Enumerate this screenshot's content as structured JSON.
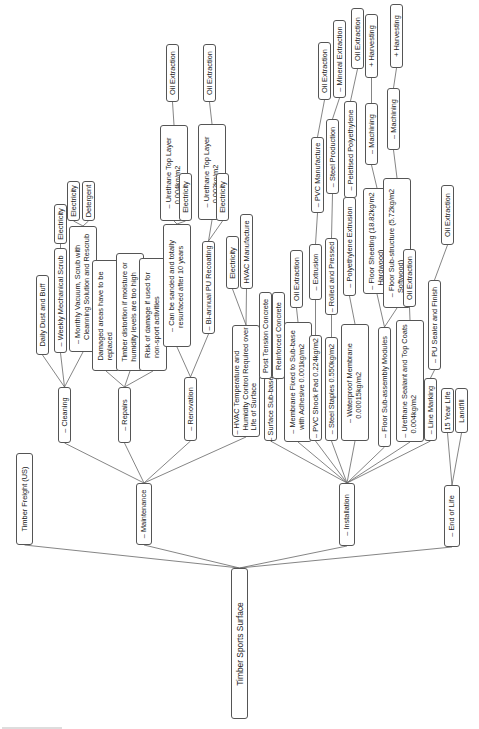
{
  "diagram": {
    "title": "Timber Sports Surface",
    "nodes": [
      {
        "id": "root",
        "label": "Timber Sports Surface"
      },
      {
        "id": "freight",
        "label": "Timber Freight (US)"
      },
      {
        "id": "maintenance",
        "label": "– Maintenance"
      },
      {
        "id": "installation",
        "label": "– Installation"
      },
      {
        "id": "endoflife",
        "label": "– End of Life"
      },
      {
        "id": "cleaning",
        "label": "– Cleaning"
      },
      {
        "id": "repairs",
        "label": "– Repairs"
      },
      {
        "id": "renovation",
        "label": "– Renovation"
      },
      {
        "id": "hvac",
        "label": "– HVAC Temperature and\n  Humidity Control Required over\n  Life of Surface"
      },
      {
        "id": "daily",
        "label": "Daily Dust and Buff"
      },
      {
        "id": "weekly",
        "label": "– Weekly Mechanical Scrub"
      },
      {
        "id": "monthly",
        "label": "– Monthly Vacuum, Scrub with\n  Cleanning Solution and Rescrub"
      },
      {
        "id": "weekly_elec",
        "label": "Electricity"
      },
      {
        "id": "monthly_elec",
        "label": "Electricity"
      },
      {
        "id": "monthly_det",
        "label": "Detergent"
      },
      {
        "id": "damaged",
        "label": "Damaged areas have to be\nreplaced"
      },
      {
        "id": "distortion",
        "label": "Timber distortion if moisture or\nhumidity levels are too high"
      },
      {
        "id": "risk",
        "label": "Risk of damage if used for\nnon-sport activities"
      },
      {
        "id": "sanded",
        "label": "– Can be sanded and totally\n  resurfaced after 10 years"
      },
      {
        "id": "biannual",
        "label": "– Bi-annual PU Recoating"
      },
      {
        "id": "ut1",
        "label": "– Urethane Top Layer\n  0.004kg/m2"
      },
      {
        "id": "ut1_elec",
        "label": "Electricity"
      },
      {
        "id": "ut1_oil",
        "label": "Oil Extraction"
      },
      {
        "id": "ut2",
        "label": "– Urethane Top Layer\n  0.002kg/m2"
      },
      {
        "id": "ut2_elec",
        "label": "Electricity"
      },
      {
        "id": "ut2_oil",
        "label": "Oil Extraction"
      },
      {
        "id": "hvac_elec",
        "label": "Electricity"
      },
      {
        "id": "hvac_manu",
        "label": "HVAC Manufacture"
      },
      {
        "id": "subbase",
        "label": "– Surface Sub-base"
      },
      {
        "id": "ptc",
        "label": "Post Tension Concrete"
      },
      {
        "id": "rc",
        "label": "Reinforced Concrete"
      },
      {
        "id": "membrane",
        "label": "– Membrane Fixed to Sub-base\n  with Adhesive 0.001kg/m2"
      },
      {
        "id": "membrane_oil",
        "label": "Oil Extraction"
      },
      {
        "id": "pvc",
        "label": "– PVC Shock Pad 0.224kg/m2"
      },
      {
        "id": "extrusion",
        "label": "– Extrusion"
      },
      {
        "id": "pvcmanu",
        "label": "– PVC Manufacture"
      },
      {
        "id": "pvcmanu_oil",
        "label": "Oil Extraction"
      },
      {
        "id": "staples",
        "label": "– Steel Staples 0.550kg/m2"
      },
      {
        "id": "rolled",
        "label": "– Rolled and Pressed"
      },
      {
        "id": "steelprod",
        "label": "– Steel Production"
      },
      {
        "id": "mineral",
        "label": "– Mineral Extraction"
      },
      {
        "id": "waterproof",
        "label": "– Waterproof Membrane\n  0.00015kg/m2"
      },
      {
        "id": "polyext",
        "label": "– Polyethylene Extrusion"
      },
      {
        "id": "peletised",
        "label": "– Peletised Polyethylene"
      },
      {
        "id": "peletised_oil",
        "label": "Oil Extraction"
      },
      {
        "id": "floormod",
        "label": "– Floor Sub-assembly Modules"
      },
      {
        "id": "sheeting",
        "label": "– Floor Sheeting (18.82kg/m2\n  Hardwood)"
      },
      {
        "id": "machining1",
        "label": "– Machining"
      },
      {
        "id": "harvest1",
        "label": "+ Harvesting"
      },
      {
        "id": "substructure",
        "label": "– Floor Sub-structure (5.72kg/m2\n  Softwood)"
      },
      {
        "id": "machining2",
        "label": "– Machining"
      },
      {
        "id": "harvest2",
        "label": "+ Harvesting"
      },
      {
        "id": "urethane_seal",
        "label": "– Urethane Sealant and Top Coats\n  0.004kg/m2"
      },
      {
        "id": "useal_oil",
        "label": "Oil Extraction"
      },
      {
        "id": "linemark",
        "label": "– Line Marking"
      },
      {
        "id": "pusealer",
        "label": "– PU Sealer and Finish"
      },
      {
        "id": "pusealer_oil",
        "label": "Oil Extraction"
      },
      {
        "id": "life15",
        "label": "15 Year Life"
      },
      {
        "id": "landfill",
        "label": "Landfill"
      }
    ],
    "edges": [
      [
        "root",
        "freight"
      ],
      [
        "root",
        "maintenance"
      ],
      [
        "root",
        "installation"
      ],
      [
        "root",
        "endoflife"
      ],
      [
        "maintenance",
        "cleaning"
      ],
      [
        "maintenance",
        "repairs"
      ],
      [
        "maintenance",
        "renovation"
      ],
      [
        "maintenance",
        "hvac"
      ],
      [
        "cleaning",
        "daily"
      ],
      [
        "cleaning",
        "weekly"
      ],
      [
        "cleaning",
        "monthly"
      ],
      [
        "weekly",
        "weekly_elec"
      ],
      [
        "monthly",
        "monthly_elec"
      ],
      [
        "monthly",
        "monthly_det"
      ],
      [
        "repairs",
        "damaged"
      ],
      [
        "repairs",
        "distortion"
      ],
      [
        "repairs",
        "risk"
      ],
      [
        "renovation",
        "sanded"
      ],
      [
        "renovation",
        "biannual"
      ],
      [
        "sanded",
        "ut1"
      ],
      [
        "sanded",
        "ut1_elec"
      ],
      [
        "ut1",
        "ut1_oil"
      ],
      [
        "biannual",
        "ut2"
      ],
      [
        "biannual",
        "ut2_elec"
      ],
      [
        "ut2",
        "ut2_oil"
      ],
      [
        "hvac",
        "hvac_elec"
      ],
      [
        "hvac",
        "hvac_manu"
      ],
      [
        "installation",
        "subbase"
      ],
      [
        "installation",
        "membrane"
      ],
      [
        "installation",
        "pvc"
      ],
      [
        "installation",
        "staples"
      ],
      [
        "installation",
        "waterproof"
      ],
      [
        "installation",
        "floormod"
      ],
      [
        "installation",
        "urethane_seal"
      ],
      [
        "installation",
        "linemark"
      ],
      [
        "subbase",
        "ptc"
      ],
      [
        "subbase",
        "rc"
      ],
      [
        "membrane",
        "membrane_oil"
      ],
      [
        "pvc",
        "extrusion"
      ],
      [
        "extrusion",
        "pvcmanu"
      ],
      [
        "pvcmanu",
        "pvcmanu_oil"
      ],
      [
        "staples",
        "rolled"
      ],
      [
        "rolled",
        "steelprod"
      ],
      [
        "steelprod",
        "mineral"
      ],
      [
        "waterproof",
        "polyext"
      ],
      [
        "polyext",
        "peletised"
      ],
      [
        "peletised",
        "peletised_oil"
      ],
      [
        "floormod",
        "sheeting"
      ],
      [
        "floormod",
        "substructure"
      ],
      [
        "sheeting",
        "machining1"
      ],
      [
        "machining1",
        "harvest1"
      ],
      [
        "substructure",
        "machining2"
      ],
      [
        "machining2",
        "harvest2"
      ],
      [
        "urethane_seal",
        "useal_oil"
      ],
      [
        "linemark",
        "pusealer"
      ],
      [
        "pusealer",
        "pusealer_oil"
      ],
      [
        "endoflife",
        "life15"
      ],
      [
        "endoflife",
        "landfill"
      ]
    ]
  }
}
